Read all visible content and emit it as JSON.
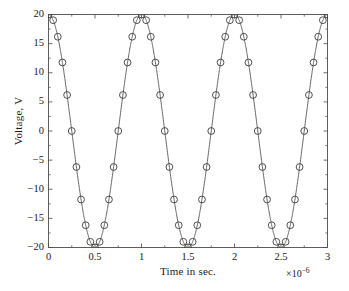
{
  "chart_data": {
    "type": "line",
    "title": "",
    "xlabel": "Time in sec.",
    "ylabel": "Voltage, V",
    "x_exponent_label": "×10",
    "x_exponent_power": "−6",
    "x_scale_factor": 1e-06,
    "xlim": [
      0,
      3
    ],
    "ylim": [
      -20,
      20
    ],
    "xticks": [
      0,
      0.5,
      1,
      1.5,
      2,
      2.5,
      3
    ],
    "xtick_labels": [
      "0",
      "0.5",
      "1",
      "1.5",
      "2",
      "2.5",
      "3"
    ],
    "yticks": [
      20,
      15,
      10,
      5,
      0,
      -5,
      -10,
      -15,
      -20
    ],
    "ytick_labels": [
      "20",
      "15",
      "10",
      "5",
      "0",
      "−5",
      "−10",
      "−15",
      "−20"
    ],
    "x_minor_ticks": [
      0.25,
      0.75,
      1.25,
      1.75,
      2.25,
      2.75
    ],
    "y_minor_ticks": [
      17.5,
      12.5,
      7.5,
      2.5,
      -2.5,
      -7.5,
      -12.5,
      -17.5
    ],
    "grid": false,
    "legend": false,
    "box": true,
    "tick_direction": "in",
    "line_color": "#555555",
    "marker_color": "#333333",
    "marker_face": "none",
    "marker": "circle",
    "marker_size": 3.4,
    "line_width": 0.9,
    "axis_color": "#4d4d4d",
    "background": "#ffffff",
    "amplitude": 20,
    "period": 1.0,
    "samples_per_period": 20,
    "waveform": "cosine",
    "series": [
      {
        "name": "Voltage",
        "x": [
          0,
          0.05,
          0.1,
          0.15,
          0.2,
          0.25,
          0.3,
          0.35,
          0.4,
          0.45,
          0.5,
          0.55,
          0.6,
          0.65,
          0.7,
          0.75,
          0.8,
          0.85,
          0.9,
          0.95,
          1,
          1.05,
          1.1,
          1.15,
          1.2,
          1.25,
          1.3,
          1.35,
          1.4,
          1.45,
          1.5,
          1.55,
          1.6,
          1.65,
          1.7,
          1.75,
          1.8,
          1.85,
          1.9,
          1.95,
          2,
          2.05,
          2.1,
          2.15,
          2.2,
          2.25,
          2.3,
          2.35,
          2.4,
          2.45,
          2.5,
          2.55,
          2.6,
          2.65,
          2.7,
          2.75,
          2.8,
          2.85,
          2.9,
          2.95,
          3
        ],
        "y": [
          20,
          19.02,
          16.18,
          11.76,
          6.18,
          0,
          -6.18,
          -11.76,
          -16.18,
          -19.02,
          -20,
          -19.02,
          -16.18,
          -11.76,
          -6.18,
          0,
          6.18,
          11.76,
          16.18,
          19.02,
          20,
          19.02,
          16.18,
          11.76,
          6.18,
          0,
          -6.18,
          -11.76,
          -16.18,
          -19.02,
          -20,
          -19.02,
          -16.18,
          -11.76,
          -6.18,
          0,
          6.18,
          11.76,
          16.18,
          19.02,
          20,
          19.02,
          16.18,
          11.76,
          6.18,
          0,
          -6.18,
          -11.76,
          -16.18,
          -19.02,
          -20,
          -19.02,
          -16.18,
          -11.76,
          -6.18,
          0,
          6.18,
          11.76,
          16.18,
          19.02,
          20
        ]
      }
    ]
  }
}
